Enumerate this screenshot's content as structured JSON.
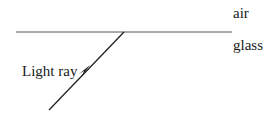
{
  "diagram": {
    "labels": {
      "top_medium": "air",
      "bottom_medium": "glass",
      "ray": "Light ray"
    },
    "colors": {
      "line": "#333333",
      "text": "#1a1a1a"
    }
  }
}
